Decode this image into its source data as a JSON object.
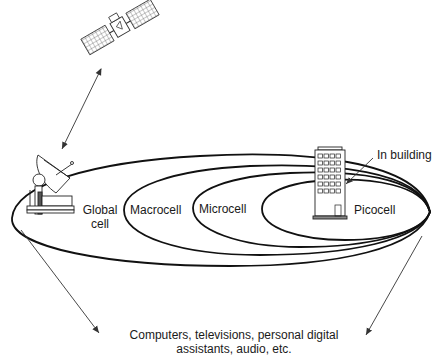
{
  "diagram": {
    "type": "nested-cell-coverage",
    "labels": {
      "global_cell_line1": "Global",
      "global_cell_line2": "cell",
      "macrocell": "Macrocell",
      "microcell": "Microcell",
      "picocell": "Picocell",
      "in_building": "In building",
      "devices_line1": "Computers, televisions, personal digital",
      "devices_line2": "assistants, audio, etc."
    },
    "nodes": [
      {
        "id": "satellite",
        "icon": "satellite-icon"
      },
      {
        "id": "ground-station",
        "icon": "satellite-dish-icon"
      },
      {
        "id": "building",
        "icon": "building-icon"
      }
    ],
    "cells": [
      "Global cell",
      "Macrocell",
      "Microcell",
      "Picocell"
    ],
    "colors": {
      "stroke": "#111111",
      "background": "#ffffff",
      "text": "#1a1a1a"
    }
  }
}
